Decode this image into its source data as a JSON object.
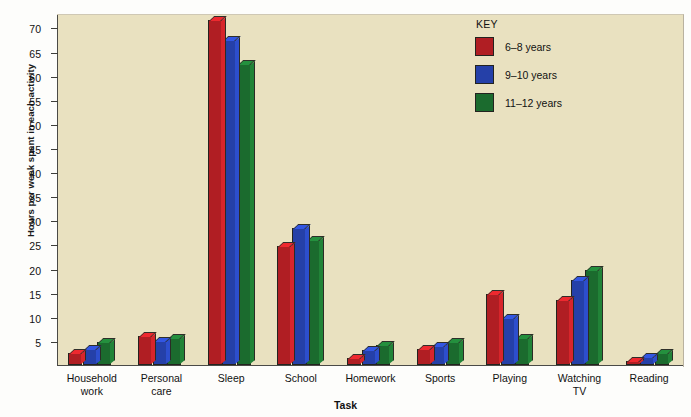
{
  "chart_data": {
    "type": "bar",
    "title": "",
    "xlabel": "Task",
    "ylabel": "Hours per week spent in each activity",
    "categories": [
      "Household\nwork",
      "Personal\ncare",
      "Sleep",
      "School",
      "Homework",
      "Sports",
      "Playing",
      "Watching\nTV",
      "Reading"
    ],
    "ylim": [
      0,
      73
    ],
    "yticks": [
      5,
      10,
      15,
      20,
      25,
      30,
      35,
      40,
      45,
      50,
      55,
      60,
      65,
      70
    ],
    "grid": false,
    "legend_position": "top-right",
    "series": [
      {
        "name": "6–8 years",
        "color": "#b01e23",
        "values": [
          2.5,
          6.0,
          71.5,
          24.7,
          1.5,
          3.3,
          14.8,
          13.4,
          0.8
        ]
      },
      {
        "name": "9–10 years",
        "color": "#2540a8",
        "values": [
          3.3,
          5.0,
          67.5,
          28.5,
          3.1,
          3.9,
          9.8,
          17.7,
          1.7
        ]
      },
      {
        "name": "11–12 years",
        "color": "#1b6b2e",
        "values": [
          4.7,
          5.7,
          62.5,
          26.0,
          4.1,
          4.7,
          5.6,
          19.8,
          2.4
        ]
      }
    ]
  },
  "legend": {
    "title": "KEY",
    "items": [
      {
        "label": "6–8 years"
      },
      {
        "label": "9–10 years"
      },
      {
        "label": "11–12 years"
      }
    ]
  },
  "axes": {
    "y_title": "Hours per week spent in each activity",
    "x_title": "Task"
  }
}
